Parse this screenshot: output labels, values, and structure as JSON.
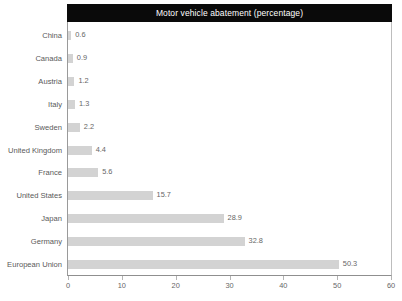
{
  "chart_data": {
    "type": "bar",
    "orientation": "horizontal",
    "title": "Motor vehicle abatement (percentage)",
    "xlabel": "",
    "ylabel": "",
    "xlim": [
      0,
      60
    ],
    "xticks": [
      0,
      10,
      20,
      30,
      40,
      50,
      60
    ],
    "grid": false,
    "legend": false,
    "bar_color": "#d3d3d3",
    "title_bar_color": "#0a0a0a",
    "title_text_color": "#ffffff",
    "label_color": "#595959",
    "value_label_color": "#666666",
    "categories": [
      "China",
      "Canada",
      "Austria",
      "Italy",
      "Sweden",
      "United Kingdom",
      "France",
      "United States",
      "Japan",
      "Germany",
      "European Union"
    ],
    "values": [
      0.6,
      0.9,
      1.2,
      1.3,
      2.2,
      4.4,
      5.6,
      15.7,
      28.9,
      32.8,
      50.3
    ],
    "value_labels": [
      "0.6",
      "0.9",
      "1.2",
      "1.3",
      "2.2",
      "4.4",
      "5.6",
      "15.7",
      "28.9",
      "32.8",
      "50.3"
    ]
  }
}
